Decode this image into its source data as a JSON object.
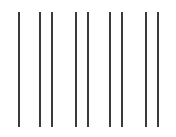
{
  "figure": {
    "line_color": "#3a3a3a",
    "background": "#ffffff",
    "line_top": 12,
    "line_bottom": 127,
    "lines_x": [
      18,
      39,
      51,
      75,
      87,
      109,
      121,
      145,
      157
    ]
  }
}
